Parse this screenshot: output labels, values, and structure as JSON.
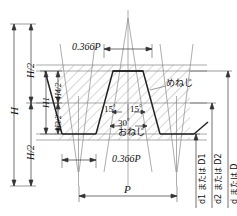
{
  "diagram": {
    "colors": {
      "line": "#2b2b2b",
      "thin": "#6e6e6e",
      "hatch": "#9a9a9a",
      "background": "#ffffff"
    },
    "dimensions": {
      "H": "H",
      "H_half_top": "H/2",
      "H_half_bottom": "H/2",
      "H1": "H1",
      "H4_half": "H4/2",
      "H3_half": "H3/2",
      "offset_top": "0.366P",
      "offset_bottom": "0.366P",
      "pitch": "P"
    },
    "angles": {
      "left_flank": "15",
      "right_flank": "15",
      "included": "30",
      "degree_symbol": "°"
    },
    "thread_labels": {
      "internal": "めねじ",
      "external": "おねじ"
    },
    "diameters": {
      "minor": "d1 または D1",
      "pitch": "d2 または D2",
      "major": "d または D"
    }
  }
}
